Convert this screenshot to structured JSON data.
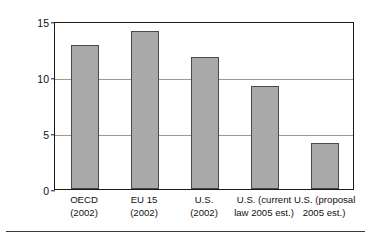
{
  "chart_data": {
    "type": "bar",
    "title": "",
    "xlabel": "",
    "ylabel": "Percentage of GDP",
    "ylim": [
      0,
      15
    ],
    "yticks": [
      0,
      5,
      10,
      15
    ],
    "ytick_labels": [
      "0",
      "5",
      "10",
      "15"
    ],
    "grid": true,
    "gridlines_at": [
      5,
      10
    ],
    "legend": null,
    "bar_color": "#a9a9a9",
    "bar_edge_color": "#4a4a4a",
    "categories": [
      "OECD (2002)",
      "EU 15 (2002)",
      "U.S. (2002)",
      "U.S. (current law 2005 est.)",
      "U.S. (proposal 2005 est.)"
    ],
    "category_lines": [
      [
        "OECD",
        "(2002)"
      ],
      [
        "EU 15",
        "(2002)"
      ],
      [
        "U.S.",
        "(2002)"
      ],
      [
        "U.S. (current",
        "law 2005 est.)"
      ],
      [
        "U.S. (proposal",
        "2005 est.)"
      ]
    ],
    "values": [
      12.9,
      14.1,
      11.8,
      9.2,
      4.1
    ]
  }
}
